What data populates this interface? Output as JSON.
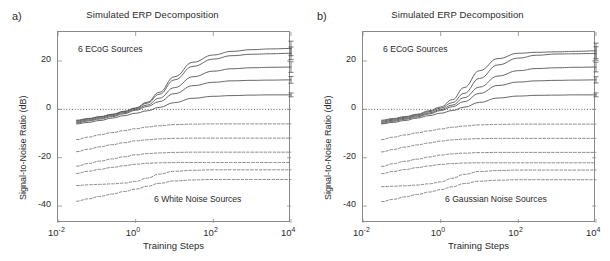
{
  "figure": {
    "panels": [
      {
        "label": "a)",
        "title": "Simulated ERP Decomposition",
        "annotation_top": "6 ECoG Sources",
        "annotation_bottom": "6 White Noise Sources"
      },
      {
        "label": "b)",
        "title": "Simulated ERP Decomposition",
        "annotation_top": "6 ECoG Sources",
        "annotation_bottom": "6 Gaussian Noise Sources"
      }
    ],
    "axes": {
      "xlabel": "Training Steps",
      "ylabel": "Signal-to-Noise Ratio (dB)",
      "xticks": [
        "10-2",
        "100",
        "102",
        "104"
      ],
      "xtick_mantissa": "10",
      "xtick_exponents": [
        "-2",
        "0",
        "2",
        "4"
      ],
      "yticks": [
        "20",
        "0",
        "-20",
        "-40"
      ]
    },
    "colors": {
      "axis": "#8a8a8a",
      "signal_curve": "#4a4a4a",
      "noise_curve": "#6b6b6b",
      "zero_line": "#3a3a3a",
      "text": "#2a2a2a"
    }
  },
  "chart_data": [
    {
      "type": "line",
      "panel": "a",
      "title": "Simulated ERP Decomposition",
      "xlabel": "Training Steps",
      "ylabel": "Signal-to-Noise Ratio (dB)",
      "xscale": "log",
      "xlim": [
        0.01,
        10000
      ],
      "ylim": [
        -47,
        32
      ],
      "yticks": [
        20,
        0,
        -20,
        -40
      ],
      "xticks": [
        0.01,
        1,
        100,
        10000
      ],
      "grid": false,
      "legend": "none",
      "zero_reference_line": 0,
      "x": [
        0.03,
        0.06,
        0.12,
        0.25,
        0.5,
        1,
        2,
        4,
        10,
        30,
        100,
        300,
        1000,
        3000,
        10000
      ],
      "series": [
        {
          "name": "ECoG source 1",
          "style": "solid",
          "group": "signal",
          "values": [
            -4.5,
            -3.8,
            -3.0,
            -2.0,
            -0.8,
            0.6,
            3.0,
            7.0,
            13.5,
            19.5,
            22.5,
            24.0,
            24.7,
            25.0,
            25.2
          ],
          "errorbar_end": 3.0
        },
        {
          "name": "ECoG source 2",
          "style": "solid",
          "group": "signal",
          "values": [
            -4.8,
            -4.0,
            -3.2,
            -2.2,
            -1.0,
            0.4,
            2.6,
            6.2,
            12.2,
            17.8,
            20.8,
            22.2,
            22.8,
            23.0,
            23.2
          ],
          "errorbar_end": 2.6
        },
        {
          "name": "ECoG source 3",
          "style": "solid",
          "group": "signal",
          "values": [
            -5.2,
            -4.4,
            -3.6,
            -2.6,
            -1.4,
            0.0,
            1.8,
            4.6,
            9.0,
            13.5,
            15.8,
            16.8,
            17.2,
            17.4,
            17.5
          ],
          "errorbar_end": 2.2
        },
        {
          "name": "ECoG source 4",
          "style": "solid",
          "group": "signal",
          "values": [
            -5.6,
            -4.8,
            -4.0,
            -3.0,
            -1.8,
            -0.4,
            1.2,
            3.2,
            6.5,
            9.8,
            11.2,
            11.8,
            12.0,
            12.1,
            12.2
          ],
          "errorbar_end": 1.4
        },
        {
          "name": "ECoG source 5",
          "style": "solid",
          "group": "signal",
          "values": [
            -6.0,
            -5.4,
            -4.6,
            -3.6,
            -2.6,
            -1.6,
            -0.6,
            0.8,
            2.8,
            4.6,
            5.4,
            5.7,
            5.9,
            6.0,
            6.0
          ],
          "errorbar_end": 0.8
        },
        {
          "name": "White noise 1",
          "style": "dashed",
          "group": "noise",
          "values": [
            -12.5,
            -11.5,
            -10.5,
            -9.6,
            -8.8,
            -8.0,
            -7.3,
            -6.8,
            -6.3,
            -6.1,
            -6.0,
            -6.0,
            -6.0,
            -6.0,
            -6.0
          ]
        },
        {
          "name": "White noise 2",
          "style": "dashed",
          "group": "noise",
          "values": [
            -17.5,
            -16.5,
            -15.5,
            -14.6,
            -13.8,
            -13.0,
            -12.6,
            -12.2,
            -12.0,
            -11.9,
            -11.9,
            -11.9,
            -11.9,
            -11.9,
            -11.9
          ]
        },
        {
          "name": "White noise 3",
          "style": "dashed",
          "group": "noise",
          "values": [
            -23.5,
            -22.4,
            -21.4,
            -20.5,
            -19.6,
            -18.8,
            -18.3,
            -18.0,
            -17.8,
            -17.7,
            -17.7,
            -17.7,
            -17.7,
            -17.7,
            -17.7
          ]
        },
        {
          "name": "White noise 4",
          "style": "dashed",
          "group": "noise",
          "values": [
            -26.5,
            -25.6,
            -24.8,
            -24.0,
            -23.3,
            -22.7,
            -22.3,
            -22.1,
            -22.0,
            -22.0,
            -22.0,
            -22.0,
            -22.0,
            -22.0,
            -22.0
          ]
        },
        {
          "name": "White noise 5",
          "style": "dashed",
          "group": "noise",
          "values": [
            -31.5,
            -31.2,
            -31.0,
            -30.8,
            -30.5,
            -29.8,
            -28.4,
            -26.8,
            -25.6,
            -25.2,
            -25.0,
            -25.0,
            -25.0,
            -25.0,
            -25.0
          ]
        },
        {
          "name": "White noise 6",
          "style": "dashed",
          "group": "noise",
          "values": [
            -38.0,
            -37.0,
            -36.0,
            -35.0,
            -34.0,
            -33.0,
            -31.8,
            -30.6,
            -29.6,
            -29.2,
            -29.0,
            -29.0,
            -29.0,
            -29.0,
            -29.0
          ]
        }
      ]
    },
    {
      "type": "line",
      "panel": "b",
      "title": "Simulated ERP Decomposition",
      "xlabel": "Training Steps",
      "ylabel": "Signal-to-Noise Ratio (dB)",
      "xscale": "log",
      "xlim": [
        0.01,
        10000
      ],
      "ylim": [
        -47,
        32
      ],
      "yticks": [
        20,
        0,
        -20,
        -40
      ],
      "xticks": [
        0.01,
        1,
        100,
        10000
      ],
      "grid": false,
      "legend": "none",
      "zero_reference_line": 0,
      "x": [
        0.03,
        0.06,
        0.12,
        0.25,
        0.5,
        1,
        2,
        4,
        10,
        30,
        100,
        300,
        1000,
        3000,
        10000
      ],
      "series": [
        {
          "name": "ECoG source 1",
          "style": "solid",
          "group": "signal",
          "values": [
            -4.5,
            -3.8,
            -3.0,
            -2.0,
            -0.6,
            1.0,
            4.0,
            9.0,
            16.0,
            21.0,
            23.2,
            23.6,
            23.8,
            24.0,
            24.2
          ],
          "errorbar_end": 3.2
        },
        {
          "name": "ECoG source 2",
          "style": "solid",
          "group": "signal",
          "values": [
            -4.9,
            -4.1,
            -3.3,
            -2.3,
            -1.0,
            0.5,
            2.8,
            6.6,
            12.8,
            18.4,
            21.2,
            22.4,
            22.9,
            23.0,
            23.1
          ],
          "errorbar_end": 2.8
        },
        {
          "name": "ECoG source 3",
          "style": "solid",
          "group": "signal",
          "values": [
            -5.3,
            -4.5,
            -3.7,
            -2.7,
            -1.5,
            -0.1,
            1.8,
            4.8,
            9.2,
            13.8,
            16.0,
            16.9,
            17.2,
            17.4,
            17.5
          ],
          "errorbar_end": 2.0
        },
        {
          "name": "ECoG source 4",
          "style": "solid",
          "group": "signal",
          "values": [
            -5.7,
            -4.9,
            -4.1,
            -3.1,
            -1.9,
            -0.5,
            1.1,
            3.2,
            6.6,
            9.9,
            11.3,
            11.8,
            12.0,
            12.1,
            12.2
          ],
          "errorbar_end": 1.3
        },
        {
          "name": "ECoG source 5",
          "style": "solid",
          "group": "signal",
          "values": [
            -6.0,
            -5.4,
            -4.6,
            -3.6,
            -2.6,
            -1.6,
            -0.5,
            0.9,
            2.9,
            4.7,
            5.5,
            5.8,
            5.9,
            6.0,
            6.0
          ],
          "errorbar_end": 0.8
        },
        {
          "name": "Gaussian noise 1",
          "style": "dashed",
          "group": "noise",
          "values": [
            -12.5,
            -11.5,
            -10.6,
            -9.7,
            -8.9,
            -8.1,
            -7.4,
            -6.9,
            -6.4,
            -6.2,
            -6.1,
            -6.1,
            -6.1,
            -6.1,
            -6.1
          ]
        },
        {
          "name": "Gaussian noise 2",
          "style": "dashed",
          "group": "noise",
          "values": [
            -17.6,
            -16.6,
            -15.6,
            -14.7,
            -13.9,
            -13.1,
            -12.6,
            -12.3,
            -12.1,
            -12.0,
            -12.0,
            -12.0,
            -12.0,
            -12.0,
            -12.0
          ]
        },
        {
          "name": "Gaussian noise 3",
          "style": "dashed",
          "group": "noise",
          "values": [
            -23.6,
            -22.5,
            -21.5,
            -20.6,
            -19.7,
            -18.9,
            -18.4,
            -18.1,
            -17.9,
            -17.8,
            -17.8,
            -17.8,
            -17.8,
            -17.8,
            -17.8
          ]
        },
        {
          "name": "Gaussian noise 4",
          "style": "dashed",
          "group": "noise",
          "values": [
            -26.6,
            -25.7,
            -24.9,
            -24.1,
            -23.4,
            -22.8,
            -22.4,
            -22.2,
            -22.1,
            -22.1,
            -22.1,
            -22.1,
            -22.1,
            -22.1,
            -22.1
          ]
        },
        {
          "name": "Gaussian noise 5",
          "style": "dashed",
          "group": "noise",
          "values": [
            -32.0,
            -31.8,
            -31.6,
            -31.3,
            -30.8,
            -30.0,
            -28.5,
            -26.9,
            -25.7,
            -25.3,
            -25.1,
            -25.1,
            -25.1,
            -25.1,
            -25.1
          ]
        },
        {
          "name": "Gaussian noise 6",
          "style": "dashed",
          "group": "noise",
          "values": [
            -38.2,
            -37.2,
            -36.2,
            -35.2,
            -34.2,
            -33.2,
            -32.0,
            -30.7,
            -29.7,
            -29.3,
            -29.1,
            -29.1,
            -29.1,
            -29.1,
            -29.1
          ]
        }
      ]
    }
  ]
}
